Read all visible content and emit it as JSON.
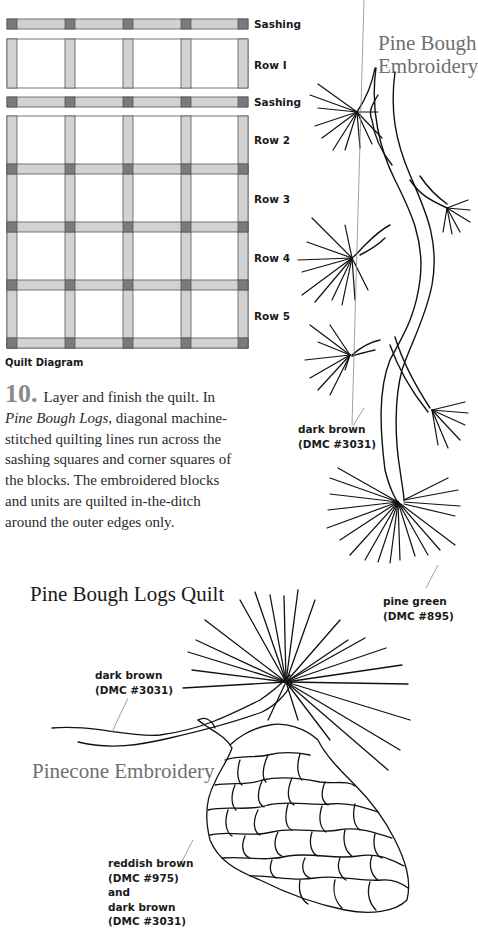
{
  "quilt_diagram": {
    "caption": "Quilt Diagram",
    "labels": {
      "sashing_1": "Sashing",
      "row_1": "Row I",
      "sashing_2": "Sashing",
      "row_2": "Row 2",
      "row_3": "Row 3",
      "row_4": "Row 4",
      "row_5": "Row 5"
    },
    "colors": {
      "sashing": "#d2d2d2",
      "cornerstone": "#7a7a7a",
      "block": "#ffffff",
      "outline": "#555555"
    }
  },
  "instructions": {
    "step_number": "10.",
    "step_lead": "Layer and finish the quilt. In",
    "italic_title": "Pine Bough Logs",
    "step_rest": ", diagonal machine-stitched quilting lines run across the sashing squares and corner squares of the blocks. The embroidered blocks and units are quilted in-the-ditch around the outer edges only."
  },
  "pine_bough": {
    "title_line1": "Pine Bough",
    "title_line2": "Embroidery",
    "callouts": {
      "dark_brown_name": "dark brown",
      "dark_brown_code": "(DMC #3031)",
      "pine_green_name": "pine green",
      "pine_green_code": "(DMC #895)"
    }
  },
  "pinecone": {
    "section_title": "Pine Bough Logs Quilt",
    "title": "Pinecone Embroidery",
    "callouts": {
      "branch_name": "dark brown",
      "branch_code": "(DMC #3031)",
      "cone_name_1": "reddish brown",
      "cone_code_1": "(DMC #975)",
      "cone_and": "and",
      "cone_name_2": "dark brown",
      "cone_code_2": "(DMC #3031)"
    }
  }
}
